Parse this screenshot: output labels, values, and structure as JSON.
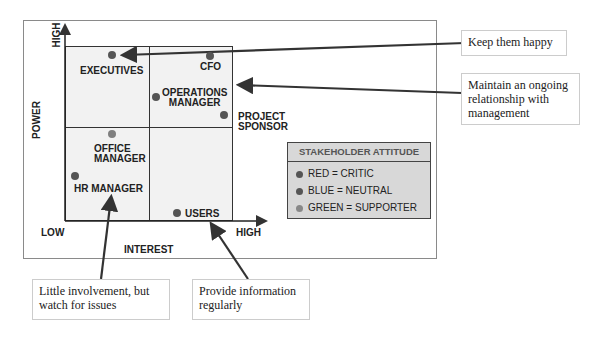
{
  "axes": {
    "y_label": "POWER",
    "y_high": "HIGH",
    "x_label": "INTEREST",
    "x_low": "LOW",
    "x_high": "HIGH"
  },
  "stakeholders": [
    {
      "name": "EXECUTIVES",
      "attitude": "red"
    },
    {
      "name": "CFO",
      "attitude": "red"
    },
    {
      "name": "OPERATIONS MANAGER",
      "line1": "OPERATIONS",
      "line2": "MANAGER",
      "attitude": "blue"
    },
    {
      "name": "PROJECT SPONSOR",
      "line1": "PROJECT",
      "line2": "SPONSOR",
      "attitude": "green"
    },
    {
      "name": "OFFICE MANAGER",
      "line1": "OFFICE",
      "line2": "MANAGER",
      "attitude": "green"
    },
    {
      "name": "HR MANAGER",
      "attitude": "red"
    },
    {
      "name": "USERS",
      "attitude": "blue"
    }
  ],
  "legend": {
    "title": "STAKEHOLDER ATTITUDE",
    "items": [
      {
        "label": "RED = CRITIC",
        "color": "#555555"
      },
      {
        "label": "BLUE = NEUTRAL",
        "color": "#505050"
      },
      {
        "label": "GREEN = SUPPORTER",
        "color": "#808080"
      }
    ]
  },
  "callouts": [
    {
      "text": "Keep them happy"
    },
    {
      "text": "Maintain an ongoing relationship with management"
    },
    {
      "text": "Little involvement, but watch for issues"
    },
    {
      "text": "Provide information regularly"
    }
  ]
}
